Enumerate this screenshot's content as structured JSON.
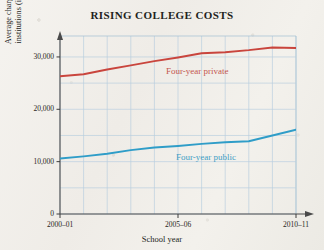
{
  "chart_data": {
    "type": "line",
    "title": "RISING COLLEGE COSTS",
    "xlabel": "School year",
    "ylabel": "Average charges at four-year institutions (in 2010 dollars)",
    "ylabel_line1": "Average charges at four-year",
    "ylabel_line2": "institutions (in 2010 dollars)",
    "x": [
      "2000–01",
      "2001–02",
      "2002–03",
      "2003–04",
      "2004–05",
      "2005–06",
      "2006–07",
      "2007–08",
      "2008–09",
      "2009–10",
      "2010–11"
    ],
    "xtick_labels": [
      "2000–01",
      "2005–06",
      "2010–11"
    ],
    "xtick_values": [
      "2000–01",
      "2005–06",
      "2010–11"
    ],
    "ytick_labels": [
      "0",
      "10,000",
      "20,000",
      "30,000"
    ],
    "ytick_values": [
      0,
      10000,
      20000,
      30000
    ],
    "ylim": [
      0,
      34000
    ],
    "grid": true,
    "grid_color": "#b9cfe0",
    "legend_position": "inline-annotations",
    "series": [
      {
        "name": "Four-year private",
        "color": "#c9453d",
        "values": [
          26300,
          26700,
          27600,
          28400,
          29200,
          29900,
          30700,
          30900,
          31300,
          31800,
          31700
        ]
      },
      {
        "name": "Four-year public",
        "color": "#2f9dc8",
        "values": [
          10600,
          11000,
          11500,
          12200,
          12700,
          13000,
          13400,
          13700,
          13900,
          15000,
          16100
        ]
      }
    ],
    "annotations": [
      {
        "text": "Four-year private",
        "color": "#c4564f"
      },
      {
        "text": "Four-year public",
        "color": "#3f9ec4"
      }
    ]
  }
}
